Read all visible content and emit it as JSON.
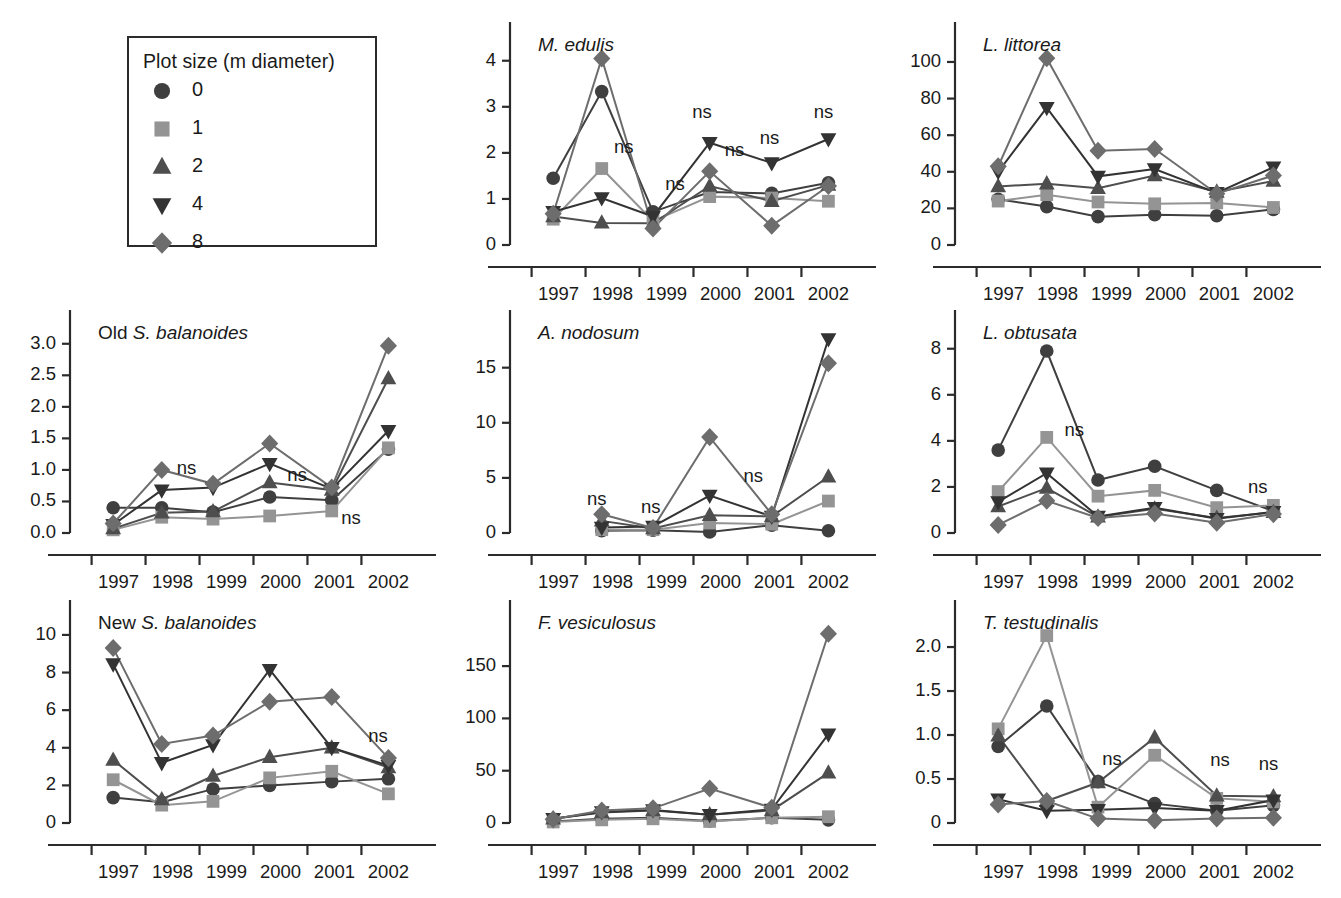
{
  "legend": {
    "title": "Plot size (m diameter)",
    "items": [
      {
        "label": "0",
        "marker": "circle",
        "color": "#3f3f3f"
      },
      {
        "label": "1",
        "marker": "square",
        "color": "#949494"
      },
      {
        "label": "2",
        "marker": "triangle-up",
        "color": "#4e4e4e"
      },
      {
        "label": "4",
        "marker": "triangle-down",
        "color": "#333333"
      },
      {
        "label": "8",
        "marker": "diamond",
        "color": "#6d6d6d"
      }
    ]
  },
  "series_order": [
    "0",
    "1",
    "2",
    "4",
    "8"
  ],
  "x_tick_labels": [
    "1997",
    "1998",
    "1999",
    "2000",
    "2001",
    "2002"
  ],
  "chart_data": [
    {
      "id": "m-edulis",
      "type": "line",
      "title": "M. edulis",
      "title_italic": true,
      "xlabel": "",
      "ylabel": "",
      "x": [
        1997.4,
        1998.3,
        1999.25,
        2000.3,
        2001.45,
        2002.5
      ],
      "xlim": [
        1996.6,
        2002.9
      ],
      "ylim": [
        0,
        4.45
      ],
      "yticks": [
        0,
        1,
        2,
        3,
        4
      ],
      "ytick_labels": [
        "0",
        "1",
        "2",
        "3",
        "4"
      ],
      "series": [
        {
          "name": "0",
          "marker": "circle",
          "color": "#3f3f3f",
          "values": [
            1.45,
            3.33,
            0.72,
            1.15,
            1.12,
            1.35
          ]
        },
        {
          "name": "1",
          "marker": "square",
          "color": "#949494",
          "values": [
            0.56,
            1.66,
            0.52,
            1.05,
            1.02,
            0.95
          ]
        },
        {
          "name": "2",
          "marker": "triangle-up",
          "color": "#4e4e4e",
          "values": [
            0.62,
            0.48,
            0.47,
            1.28,
            0.95,
            1.3
          ]
        },
        {
          "name": "4",
          "marker": "triangle-down",
          "color": "#333333",
          "values": [
            0.72,
            1.02,
            0.62,
            2.22,
            1.78,
            2.3
          ]
        },
        {
          "name": "8",
          "marker": "diamond",
          "color": "#6d6d6d",
          "values": [
            0.68,
            4.05,
            0.36,
            1.6,
            0.42,
            1.28
          ]
        }
      ],
      "annotations": [
        {
          "text": "ns",
          "x": 1998.75,
          "y": 2.1
        },
        {
          "text": "ns",
          "x": 1999.7,
          "y": 1.3
        },
        {
          "text": "ns",
          "x": 2000.2,
          "y": 2.86
        },
        {
          "text": "ns",
          "x": 2000.8,
          "y": 2.05
        },
        {
          "text": "ns",
          "x": 2001.45,
          "y": 2.3
        },
        {
          "text": "ns",
          "x": 2002.45,
          "y": 2.86
        }
      ]
    },
    {
      "id": "l-littorea",
      "type": "line",
      "title": "L. littorea",
      "title_italic": true,
      "x": [
        1997.4,
        1998.3,
        1999.25,
        2000.3,
        2001.45,
        2002.5
      ],
      "xlim": [
        1996.6,
        2002.9
      ],
      "ylim": [
        0,
        112
      ],
      "yticks": [
        0,
        20,
        40,
        60,
        80,
        100
      ],
      "ytick_labels": [
        "0",
        "20",
        "40",
        "60",
        "80",
        "100"
      ],
      "series": [
        {
          "name": "0",
          "marker": "circle",
          "color": "#3f3f3f",
          "values": [
            25.0,
            21.0,
            15.5,
            16.5,
            16.0,
            19.5
          ]
        },
        {
          "name": "1",
          "marker": "square",
          "color": "#949494",
          "values": [
            24.0,
            27.5,
            23.5,
            22.5,
            23.0,
            20.5
          ]
        },
        {
          "name": "2",
          "marker": "triangle-up",
          "color": "#4e4e4e",
          "values": [
            32.0,
            33.5,
            31.0,
            38.0,
            29.0,
            35.0
          ]
        },
        {
          "name": "4",
          "marker": "triangle-down",
          "color": "#333333",
          "values": [
            40.0,
            75.0,
            37.5,
            41.5,
            28.5,
            42.5
          ]
        },
        {
          "name": "8",
          "marker": "diamond",
          "color": "#6d6d6d",
          "values": [
            43.0,
            102.0,
            51.5,
            52.5,
            28.0,
            38.0
          ]
        }
      ],
      "annotations": []
    },
    {
      "id": "old-s-balanoides",
      "type": "line",
      "title": "Old S. balanoides",
      "title_prefix": "Old ",
      "title_italic": true,
      "x": [
        1997.4,
        1998.3,
        1999.25,
        2000.3,
        2001.45,
        2002.5
      ],
      "xlim": [
        1996.6,
        2002.9
      ],
      "ylim": [
        0,
        3.25
      ],
      "yticks": [
        0,
        0.5,
        1.0,
        1.5,
        2.0,
        2.5,
        3.0
      ],
      "ytick_labels": [
        "0.0",
        "0.5",
        "1.0",
        "1.5",
        "2.0",
        "2.5",
        "3.0"
      ],
      "series": [
        {
          "name": "0",
          "marker": "circle",
          "color": "#3f3f3f",
          "values": [
            0.4,
            0.4,
            0.33,
            0.57,
            0.52,
            1.33
          ]
        },
        {
          "name": "1",
          "marker": "square",
          "color": "#949494",
          "values": [
            0.05,
            0.25,
            0.22,
            0.27,
            0.35,
            1.35
          ]
        },
        {
          "name": "2",
          "marker": "triangle-up",
          "color": "#4e4e4e",
          "values": [
            0.07,
            0.32,
            0.34,
            0.8,
            0.68,
            2.45
          ]
        },
        {
          "name": "4",
          "marker": "triangle-down",
          "color": "#333333",
          "values": [
            0.13,
            0.68,
            0.72,
            1.1,
            0.7,
            1.62
          ]
        },
        {
          "name": "8",
          "marker": "diamond",
          "color": "#6d6d6d",
          "values": [
            0.15,
            1.0,
            0.78,
            1.42,
            0.72,
            2.97
          ]
        }
      ],
      "annotations": [
        {
          "text": "ns",
          "x": 1998.8,
          "y": 1.02
        },
        {
          "text": "ns",
          "x": 2000.85,
          "y": 0.9
        },
        {
          "text": "ns",
          "x": 2001.85,
          "y": 0.22
        }
      ]
    },
    {
      "id": "a-nodosum",
      "type": "line",
      "title": "A. nodosum",
      "title_italic": true,
      "x": [
        1998.3,
        1999.25,
        2000.3,
        2001.45,
        2002.5
      ],
      "xlim": [
        1996.6,
        2002.9
      ],
      "ylim": [
        0,
        18.6
      ],
      "yticks": [
        0,
        5,
        10,
        15
      ],
      "ytick_labels": [
        "0",
        "5",
        "10",
        "15"
      ],
      "series": [
        {
          "name": "0",
          "marker": "circle",
          "color": "#3f3f3f",
          "values": [
            0.2,
            0.25,
            0.1,
            0.7,
            0.2
          ]
        },
        {
          "name": "1",
          "marker": "square",
          "color": "#949494",
          "values": [
            0.3,
            0.3,
            0.9,
            0.8,
            2.9
          ]
        },
        {
          "name": "2",
          "marker": "triangle-up",
          "color": "#4e4e4e",
          "values": [
            1.1,
            0.4,
            1.6,
            1.5,
            5.1
          ]
        },
        {
          "name": "4",
          "marker": "triangle-down",
          "color": "#333333",
          "values": [
            0.5,
            0.6,
            3.4,
            1.5,
            17.6
          ]
        },
        {
          "name": "8",
          "marker": "diamond",
          "color": "#6d6d6d",
          "values": [
            1.7,
            0.45,
            8.7,
            1.7,
            15.4
          ]
        }
      ],
      "annotations": [
        {
          "text": "ns",
          "x": 1998.25,
          "y": 2.95
        },
        {
          "text": "ns",
          "x": 1999.25,
          "y": 2.3
        },
        {
          "text": "ns",
          "x": 2001.15,
          "y": 5.1
        }
      ]
    },
    {
      "id": "l-obtusata",
      "type": "line",
      "title": "L. obtusata",
      "title_italic": true,
      "x": [
        1997.4,
        1998.3,
        1999.25,
        2000.3,
        2001.45,
        2002.5
      ],
      "xlim": [
        1996.6,
        2002.9
      ],
      "ylim": [
        0,
        8.9
      ],
      "yticks": [
        0,
        2,
        4,
        6,
        8
      ],
      "ytick_labels": [
        "0",
        "2",
        "4",
        "6",
        "8"
      ],
      "series": [
        {
          "name": "0",
          "marker": "circle",
          "color": "#3f3f3f",
          "values": [
            3.6,
            7.9,
            2.3,
            2.9,
            1.85,
            0.95
          ]
        },
        {
          "name": "1",
          "marker": "square",
          "color": "#949494",
          "values": [
            1.8,
            4.15,
            1.6,
            1.85,
            1.1,
            1.2
          ]
        },
        {
          "name": "2",
          "marker": "triangle-up",
          "color": "#4e4e4e",
          "values": [
            1.15,
            1.95,
            0.7,
            1.05,
            0.65,
            0.9
          ]
        },
        {
          "name": "4",
          "marker": "triangle-down",
          "color": "#333333",
          "values": [
            1.35,
            2.6,
            0.72,
            1.1,
            0.62,
            0.92
          ]
        },
        {
          "name": "8",
          "marker": "diamond",
          "color": "#6d6d6d",
          "values": [
            0.35,
            1.4,
            0.65,
            0.85,
            0.45,
            0.82
          ]
        }
      ],
      "annotations": [
        {
          "text": "ns",
          "x": 1998.85,
          "y": 4.45
        },
        {
          "text": "ns",
          "x": 2002.25,
          "y": 1.95
        }
      ]
    },
    {
      "id": "new-s-balanoides",
      "type": "line",
      "title": "New S. balanoides",
      "title_prefix": "New ",
      "title_italic": true,
      "x": [
        1997.4,
        1998.3,
        1999.25,
        2000.3,
        2001.45,
        2002.5
      ],
      "xlim": [
        1996.6,
        2002.9
      ],
      "ylim": [
        0,
        10.9
      ],
      "yticks": [
        0,
        2,
        4,
        6,
        8,
        10
      ],
      "ytick_labels": [
        "0",
        "2",
        "4",
        "6",
        "8",
        "10"
      ],
      "series": [
        {
          "name": "0",
          "marker": "circle",
          "color": "#3f3f3f",
          "values": [
            1.35,
            1.1,
            1.8,
            2.0,
            2.2,
            2.35
          ]
        },
        {
          "name": "1",
          "marker": "square",
          "color": "#949494",
          "values": [
            2.3,
            0.95,
            1.15,
            2.4,
            2.75,
            1.55
          ]
        },
        {
          "name": "2",
          "marker": "triangle-up",
          "color": "#4e4e4e",
          "values": [
            3.35,
            1.25,
            2.5,
            3.5,
            4.0,
            2.95
          ]
        },
        {
          "name": "4",
          "marker": "triangle-down",
          "color": "#333333",
          "values": [
            8.45,
            3.2,
            4.15,
            8.15,
            4.0,
            3.05
          ]
        },
        {
          "name": "8",
          "marker": "diamond",
          "color": "#6d6d6d",
          "values": [
            9.3,
            4.2,
            4.65,
            6.45,
            6.7,
            3.45
          ]
        }
      ],
      "annotations": [
        {
          "text": "ns",
          "x": 2002.35,
          "y": 4.55
        }
      ]
    },
    {
      "id": "f-vesiculosus",
      "type": "line",
      "title": "F. vesiculosus",
      "title_italic": true,
      "x": [
        1997.4,
        1998.3,
        1999.25,
        2000.3,
        2001.45,
        2002.5
      ],
      "xlim": [
        1996.6,
        2002.9
      ],
      "ylim": [
        0,
        196
      ],
      "yticks": [
        0,
        50,
        100,
        150
      ],
      "ytick_labels": [
        "0",
        "50",
        "100",
        "150"
      ],
      "series": [
        {
          "name": "0",
          "marker": "circle",
          "color": "#3f3f3f",
          "values": [
            1.5,
            4.0,
            5.0,
            2.0,
            5.0,
            3.0
          ]
        },
        {
          "name": "1",
          "marker": "square",
          "color": "#949494",
          "values": [
            1.0,
            3.0,
            4.0,
            1.5,
            5.0,
            6.0
          ]
        },
        {
          "name": "2",
          "marker": "triangle-up",
          "color": "#4e4e4e",
          "values": [
            4.0,
            10.0,
            12.0,
            8.0,
            12.0,
            48.0
          ]
        },
        {
          "name": "4",
          "marker": "triangle-down",
          "color": "#333333",
          "values": [
            4.0,
            10.5,
            12.5,
            8.0,
            13.0,
            85.0
          ]
        },
        {
          "name": "8",
          "marker": "diamond",
          "color": "#6d6d6d",
          "values": [
            3.5,
            12.0,
            14.0,
            33.0,
            14.5,
            181.0
          ]
        }
      ],
      "annotations": []
    },
    {
      "id": "t-testudinalis",
      "type": "line",
      "title": "T. testudinalis",
      "title_italic": true,
      "x": [
        1997.4,
        1998.3,
        1999.25,
        2000.3,
        2001.45,
        2002.5
      ],
      "xlim": [
        1996.6,
        2002.9
      ],
      "ylim": [
        0,
        2.33
      ],
      "yticks": [
        0,
        0.5,
        1.0,
        1.5,
        2.0
      ],
      "ytick_labels": [
        "0",
        "0.5",
        "1.0",
        "1.5",
        "2.0"
      ],
      "series": [
        {
          "name": "0",
          "marker": "circle",
          "color": "#3f3f3f",
          "values": [
            0.87,
            1.33,
            0.47,
            0.22,
            0.14,
            0.2
          ]
        },
        {
          "name": "1",
          "marker": "square",
          "color": "#949494",
          "values": [
            1.07,
            2.13,
            0.18,
            0.77,
            0.28,
            0.24
          ]
        },
        {
          "name": "2",
          "marker": "triangle-up",
          "color": "#4e4e4e",
          "values": [
            0.99,
            0.25,
            0.46,
            0.97,
            0.31,
            0.3
          ]
        },
        {
          "name": "4",
          "marker": "triangle-down",
          "color": "#333333",
          "values": [
            0.27,
            0.14,
            0.15,
            0.17,
            0.14,
            0.26
          ]
        },
        {
          "name": "8",
          "marker": "diamond",
          "color": "#6d6d6d",
          "values": [
            0.21,
            0.25,
            0.05,
            0.03,
            0.05,
            0.06
          ]
        }
      ],
      "annotations": [
        {
          "text": "ns",
          "x": 1999.55,
          "y": 0.72
        },
        {
          "text": "ns",
          "x": 2001.55,
          "y": 0.7
        },
        {
          "text": "ns",
          "x": 2002.45,
          "y": 0.66
        }
      ]
    }
  ]
}
